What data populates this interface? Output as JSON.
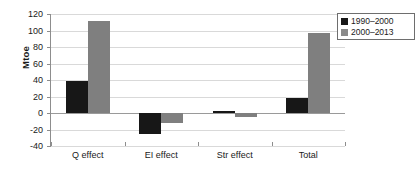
{
  "chart_data": {
    "type": "bar",
    "title": "",
    "xlabel": "",
    "ylabel": "Mtoe",
    "categories": [
      "Q effect",
      "EI effect",
      "Str effect",
      "Total"
    ],
    "series": [
      {
        "name": "1990–2000",
        "color": "#171717",
        "values": [
          39,
          -26,
          3,
          18
        ]
      },
      {
        "name": "2000–2013",
        "color": "#7f7f7f",
        "values": [
          111,
          -12,
          -5,
          97
        ]
      }
    ],
    "ylim": [
      -40,
      120
    ],
    "yticks": [
      120,
      100,
      80,
      60,
      40,
      20,
      0,
      -20,
      -40
    ],
    "ytick_labels": [
      "120",
      "100",
      "80",
      "60",
      "40",
      "20",
      "0",
      "-20",
      "-40"
    ],
    "grid": true,
    "legend_position": "top-right"
  },
  "legend": {
    "entries": [
      {
        "label": "1990–2000",
        "swatch": "black-square-icon"
      },
      {
        "label": "2000–2013",
        "swatch": "grey-square-icon"
      }
    ]
  }
}
